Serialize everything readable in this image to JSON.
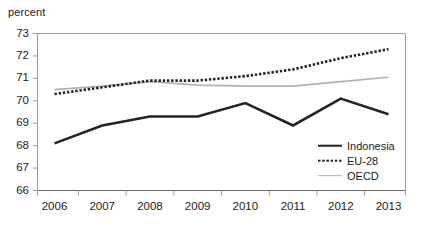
{
  "axis_unit_label": "percent",
  "legend": {
    "items": [
      {
        "label": "Indonesia",
        "style": "solid-dark",
        "color": "#242424"
      },
      {
        "label": "EU-28",
        "style": "dotted",
        "color": "#242424"
      },
      {
        "label": "OECD",
        "style": "solid-gray",
        "color": "#b2b2b2"
      }
    ]
  },
  "chart_data": {
    "type": "line",
    "title": "",
    "subtitle": "",
    "xlabel": "",
    "ylabel": "percent",
    "categories": [
      "2006",
      "2007",
      "2008",
      "2009",
      "2010",
      "2011",
      "2012",
      "2013"
    ],
    "x": [
      2006,
      2007,
      2008,
      2009,
      2010,
      2011,
      2012,
      2013
    ],
    "ylim": [
      66,
      73
    ],
    "yticks": [
      66,
      67,
      68,
      69,
      70,
      71,
      72,
      73
    ],
    "ytick_labels": [
      "66",
      "67",
      "68",
      "69",
      "70",
      "71",
      "72",
      "73"
    ],
    "xtick_labels": [
      "2006",
      "2007",
      "2008",
      "2009",
      "2010",
      "2011",
      "2012",
      "2013"
    ],
    "grid": false,
    "legend_position": "inside-bottom-right",
    "series": [
      {
        "name": "Indonesia",
        "color": "#242424",
        "linestyle": "solid",
        "linewidth": 2.6,
        "values": [
          68.1,
          68.9,
          69.3,
          69.3,
          69.9,
          68.9,
          70.1,
          69.4
        ]
      },
      {
        "name": "EU-28",
        "color": "#242424",
        "linestyle": "dotted",
        "linewidth": 2.6,
        "values": [
          70.3,
          70.6,
          70.9,
          70.9,
          71.1,
          71.4,
          71.9,
          72.3
        ]
      },
      {
        "name": "OECD",
        "color": "#b2b2b2",
        "linestyle": "solid",
        "linewidth": 1.7,
        "values": [
          70.5,
          70.65,
          70.85,
          70.7,
          70.65,
          70.65,
          70.85,
          71.05
        ]
      }
    ]
  }
}
